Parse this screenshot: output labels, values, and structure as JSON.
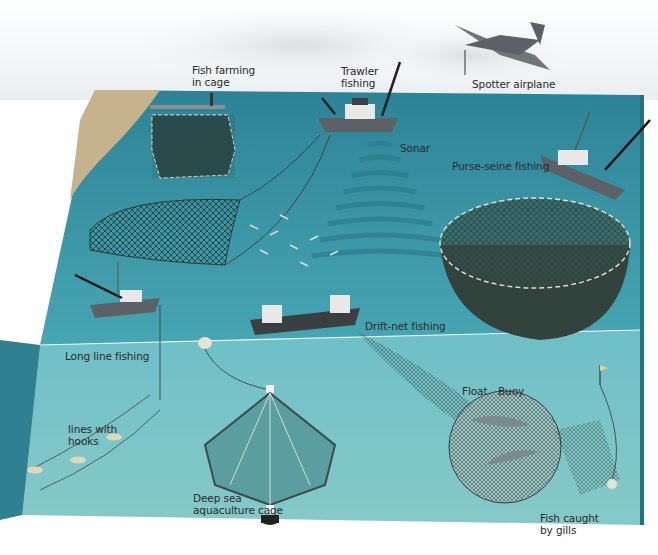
{
  "diagram": {
    "colors": {
      "sky": "#f2f4f5",
      "ocean_surface": "#2f8fa3",
      "ocean_deep": "#3aa0b0",
      "underwater": "#5fb7c2",
      "seabed_left": "#b9a27a",
      "side_wall": "#2a7f90",
      "net": "#3d4a3a",
      "label_text": "#2a2a2a"
    },
    "labels": {
      "fish_farming": "Fish farming\nin cage",
      "trawler": "Trawler\nfishing",
      "spotter": "Spotter airplane",
      "sonar": "Sonar",
      "purse_seine": "Purse-seine fishing",
      "drift_net": "Drift-net fishing",
      "long_line": "Long line fishing",
      "lines_hooks": "lines with\nhooks",
      "deep_sea": "Deep sea\naquaculture cage",
      "float": "Float",
      "buoy": "Buoy",
      "gills": "Fish caught\nby gills"
    }
  }
}
